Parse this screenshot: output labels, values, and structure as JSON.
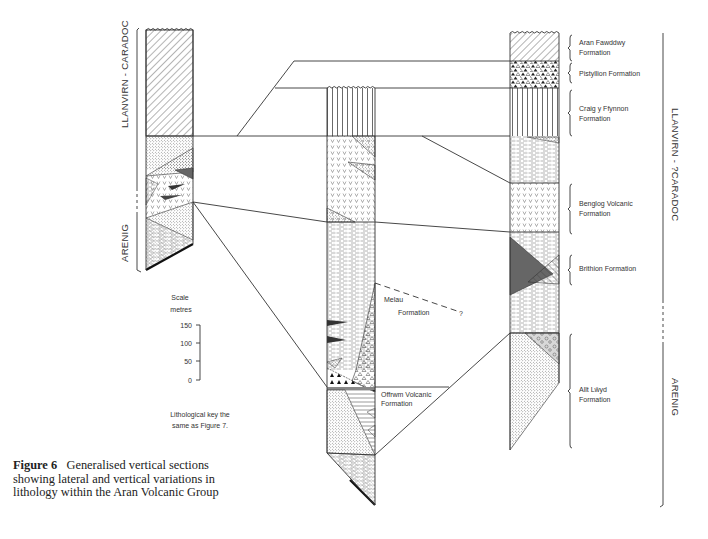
{
  "figure": {
    "number_label": "Figure 6",
    "caption": "Generalised vertical sections showing lateral and vertical variations in lithology within the Aran Volcanic Group"
  },
  "left_section": {
    "ages": [
      {
        "label": "LLANVIRN - CARADOC",
        "style": "solid"
      },
      {
        "label": "ARENIG",
        "style": "solid"
      }
    ]
  },
  "middle_section": {
    "formations": [
      {
        "label_line1": "Melau",
        "label_line2": "Formation",
        "query": "?"
      },
      {
        "label_line1": "Offrwm Volcanic",
        "label_line2": "Formation"
      }
    ]
  },
  "right_section": {
    "formations": [
      {
        "label_line1": "Aran Fawddwy",
        "label_line2": "Formation"
      },
      {
        "label_line1": "Pistyllion Formation",
        "label_line2": ""
      },
      {
        "label_line1": "Craig y Ffynnon",
        "label_line2": "Formation"
      },
      {
        "label_line1": "Benglog Volcanic",
        "label_line2": "Formation"
      },
      {
        "label_line1": "Brithion Formation",
        "label_line2": ""
      },
      {
        "label_line1": "Allt Lŵyd",
        "label_line2": "Formation"
      }
    ],
    "ages": [
      {
        "label": "LLANVIRN - ?CARADOC"
      },
      {
        "label": "ARENIG"
      }
    ]
  },
  "scale": {
    "title": "Scale",
    "unit": "metres",
    "ticks": [
      "150",
      "100",
      "50",
      "0"
    ],
    "note_line1": "Lithological key the",
    "note_line2": "same as Figure 7."
  },
  "colors": {
    "ink": "#333333",
    "dark_fill": "#555555",
    "background": "#ffffff"
  }
}
